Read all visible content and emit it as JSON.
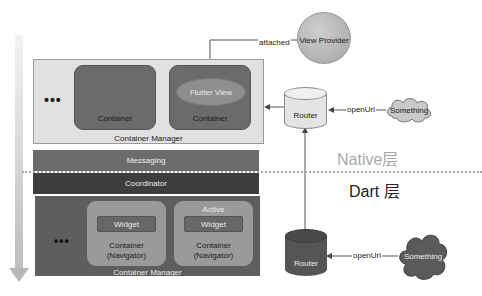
{
  "diagram": {
    "native_layer": {
      "label": "Native层",
      "container_manager": {
        "label": "Container Manager",
        "ellipsis": "•••",
        "containers": [
          {
            "label": "Container"
          },
          {
            "label": "Container",
            "flutter_view": "Flutter View"
          }
        ]
      },
      "router": {
        "label": "Router"
      },
      "view_provider": {
        "label": "View Provider"
      },
      "edge_attached": "attached",
      "something": {
        "label": "Something"
      },
      "edge_open_url": "openUrl"
    },
    "messaging": {
      "label": "Messaging"
    },
    "coordinator": {
      "label": "Coordinator"
    },
    "dart_layer": {
      "label": "Dart 层",
      "container_manager": {
        "label": "Container Manager",
        "ellipsis": "•••",
        "containers": [
          {
            "label_line1": "Container",
            "label_line2": "(Navigator)",
            "widget": "Widget"
          },
          {
            "label_line1": "Container",
            "label_line2": "(Navigator)",
            "widget": "Widget",
            "badge": "Active"
          }
        ]
      },
      "router": {
        "label": "Router"
      },
      "something": {
        "label": "Something"
      },
      "edge_open_url": "openUrl"
    },
    "colors": {
      "native_manager_bg": "#e1e1e1",
      "native_container": "#6b6b6b",
      "messaging": "#6c6c6c",
      "coordinator": "#3d3d3d",
      "dart_manager_bg": "#5e5e5e",
      "dart_container": "#9a9a9a",
      "native_router": "#e4e4e4",
      "dart_router": "#555555",
      "view_provider": "#b5b5b5",
      "native_cloud": "#c9c9c9",
      "dart_cloud": "#5a5a5a"
    }
  }
}
